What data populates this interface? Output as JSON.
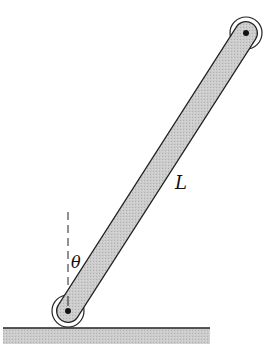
{
  "diagram": {
    "labels": {
      "length": "L",
      "angle": "θ"
    },
    "geometry": {
      "bottom_pivot": [
        68,
        311
      ],
      "top_pivot": [
        246,
        33
      ],
      "rod_width": 22,
      "ground_y": 328
    },
    "colors": {
      "rod_fill": "#c9c9c9",
      "outline": "#222222",
      "ground_fill": "#bdbdbd",
      "background": "#ffffff"
    }
  }
}
